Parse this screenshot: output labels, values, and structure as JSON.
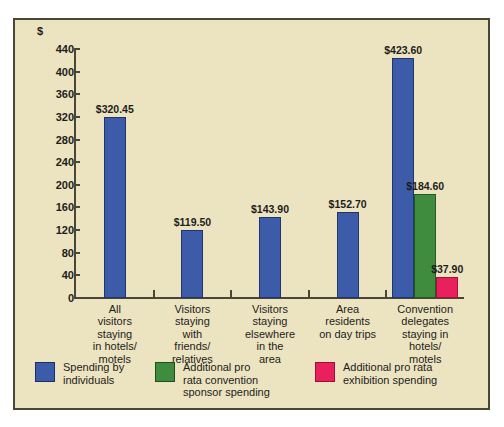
{
  "chart_data": {
    "type": "bar",
    "title": "",
    "xlabel": "",
    "ylabel": "$",
    "currency_symbol": "$",
    "ylim": [
      0,
      440
    ],
    "ytick_step": 40,
    "yticks": [
      440,
      400,
      360,
      320,
      280,
      240,
      200,
      160,
      120,
      80,
      40,
      0
    ],
    "ytick_labels": [
      "440",
      "400",
      "360",
      "320",
      "280",
      "240",
      "200",
      "160",
      "120",
      "80",
      "40",
      "0"
    ],
    "grid": false,
    "legend_position": "bottom",
    "categories": [
      "All\nvisitors\nstaying\nin hotels/\nmotels",
      "Visitors\nstaying\nwith\nfriends/\nrelatives",
      "Visitors\nstaying\nelsewhere\nin the\narea",
      "Area\nresidents\non day trips",
      "Convention\ndelegates\nstaying in\nhotels/\nmotels"
    ],
    "series": [
      {
        "name": "Spending by individuals",
        "color": "#3c5ba9",
        "values": [
          320.45,
          119.5,
          143.9,
          152.7,
          423.6
        ],
        "labels": [
          "$320.45",
          "$119.50",
          "$143.90",
          "$152.70",
          "$423.60"
        ]
      },
      {
        "name": "Additional pro rata convention sponsor spending",
        "color": "#3f8c3f",
        "values": [
          null,
          null,
          null,
          null,
          184.6
        ],
        "labels": [
          "",
          "",
          "",
          "",
          "$184.60"
        ]
      },
      {
        "name": "Additional pro rata exhibition spending",
        "color": "#e8215e",
        "values": [
          null,
          null,
          null,
          null,
          37.9
        ],
        "labels": [
          "",
          "",
          "",
          "",
          "$37.90"
        ]
      }
    ]
  },
  "legend": [
    {
      "label": "Spending by\nindividuals",
      "color": "#3c5ba9",
      "swatch": "blue"
    },
    {
      "label": "Additional pro\nrata  convention\nsponsor spending",
      "color": "#3f8c3f",
      "swatch": "green"
    },
    {
      "label": "Additional pro rata\nexhibition spending",
      "color": "#e8215e",
      "swatch": "pink"
    }
  ],
  "figure": {
    "background_color": "#ece3c0",
    "border_color": "#4a4636",
    "text_color": "#1d1d1b"
  }
}
